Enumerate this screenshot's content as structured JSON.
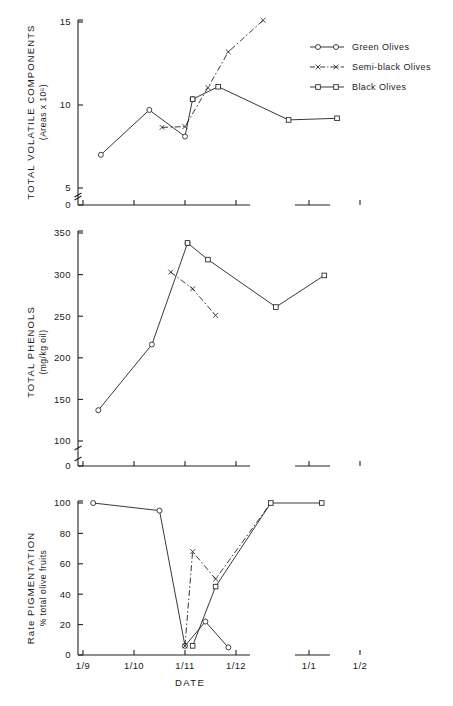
{
  "figure": {
    "xlabel": "DATE",
    "x_categories": [
      "1/9",
      "1/10",
      "1/11",
      "1/12",
      "1/1",
      "1/2"
    ],
    "x_axis_break_between": [
      "1/12",
      "1/1"
    ],
    "legend": {
      "position": "top-right",
      "entries": [
        {
          "key": "green",
          "label": "Green Olives",
          "marker": "circle",
          "line": "solid"
        },
        {
          "key": "semi_black",
          "label": "Semi-black Olives",
          "marker": "x",
          "line": "dash-dot"
        },
        {
          "key": "black",
          "label": "Black Olives",
          "marker": "square",
          "line": "solid"
        }
      ]
    }
  },
  "chart_data": [
    {
      "type": "line",
      "panel": 1,
      "title": "",
      "ylabel": "TOTAL VOLATILE COMPONENTS",
      "ylabel_units": "(Areas x 10⁶)",
      "xlabel": "DATE",
      "ylim": [
        0,
        15
      ],
      "yticks": [
        0,
        5,
        10,
        15
      ],
      "ytick_labels": [
        "0",
        "5",
        "10",
        "15"
      ],
      "y_axis_break": true,
      "grid": false,
      "x": [
        "1/9",
        "1/10",
        "1/11",
        "1/12",
        "1/1",
        "1/2"
      ],
      "series": [
        {
          "name": "Green Olives",
          "marker": "circle",
          "points": [
            [
              0.35,
              7.0
            ],
            [
              1.3,
              9.7
            ],
            [
              2.0,
              8.1
            ],
            [
              2.15,
              10.35
            ]
          ]
        },
        {
          "name": "Semi-black Olives",
          "marker": "x",
          "points": [
            [
              1.55,
              8.65
            ],
            [
              2.0,
              8.7
            ],
            [
              2.45,
              11.05
            ],
            [
              2.85,
              13.2
            ],
            [
              3.1,
              15.1
            ]
          ]
        },
        {
          "name": "Black Olives",
          "marker": "square",
          "points": [
            [
              2.15,
              10.35
            ],
            [
              2.65,
              11.1
            ],
            [
              3.6,
              9.1
            ],
            [
              4.55,
              9.2
            ]
          ]
        }
      ]
    },
    {
      "type": "line",
      "panel": 2,
      "title": "",
      "ylabel": "TOTAL PHENOLS",
      "ylabel_units": "(mg/kg oil)",
      "xlabel": "DATE",
      "ylim": [
        0,
        350
      ],
      "yticks": [
        0,
        100,
        150,
        200,
        250,
        300,
        350
      ],
      "ytick_labels": [
        "0",
        "100",
        "150",
        "200",
        "250",
        "300",
        "350"
      ],
      "y_axis_break": true,
      "grid": false,
      "x": [
        "1/9",
        "1/10",
        "1/11",
        "1/12",
        "1/1",
        "1/2"
      ],
      "series": [
        {
          "name": "Green Olives",
          "marker": "circle",
          "points": [
            [
              0.3,
              137
            ],
            [
              1.35,
              216
            ],
            [
              2.05,
              338
            ]
          ]
        },
        {
          "name": "Semi-black Olives",
          "marker": "x",
          "points": [
            [
              1.72,
              303
            ],
            [
              2.15,
              283
            ],
            [
              2.6,
              251
            ]
          ]
        },
        {
          "name": "Black Olives",
          "marker": "square",
          "points": [
            [
              2.05,
              338
            ],
            [
              2.45,
              318
            ],
            [
              3.35,
              261
            ],
            [
              4.3,
              299
            ]
          ]
        }
      ]
    },
    {
      "type": "line",
      "panel": 3,
      "title": "",
      "ylabel": "Rate PIGMENTATION",
      "ylabel_units": "% total olive fruits",
      "xlabel": "DATE",
      "ylim": [
        0,
        100
      ],
      "yticks": [
        0,
        20,
        40,
        60,
        80,
        100
      ],
      "ytick_labels": [
        "0",
        "20",
        "40",
        "60",
        "80",
        "100"
      ],
      "y_axis_break": false,
      "grid": false,
      "x": [
        "1/9",
        "1/10",
        "1/11",
        "1/12",
        "1/1",
        "1/2"
      ],
      "series": [
        {
          "name": "Green Olives",
          "marker": "circle",
          "points": [
            [
              0.2,
              100
            ],
            [
              1.5,
              95
            ],
            [
              2.0,
              6
            ],
            [
              2.4,
              22
            ],
            [
              2.85,
              5
            ]
          ]
        },
        {
          "name": "Semi-black Olives",
          "marker": "x",
          "points": [
            [
              2.0,
              6
            ],
            [
              2.15,
              68
            ],
            [
              2.6,
              50
            ],
            [
              3.25,
              100
            ]
          ]
        },
        {
          "name": "Black Olives",
          "marker": "square",
          "points": [
            [
              2.15,
              6
            ],
            [
              2.6,
              45
            ],
            [
              3.25,
              100
            ],
            [
              4.25,
              100
            ]
          ]
        }
      ]
    }
  ]
}
